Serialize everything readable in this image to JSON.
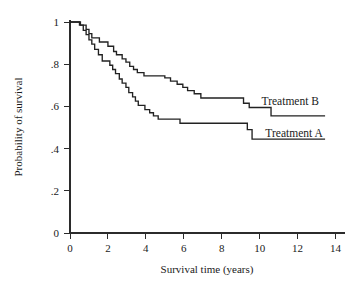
{
  "chart_data": {
    "type": "line",
    "subtype": "kaplan-meier-step",
    "title": "",
    "xlabel": "Survival time (years)",
    "ylabel": "Probability of survival",
    "xlim": [
      0,
      14.5
    ],
    "ylim": [
      0,
      1.0
    ],
    "xticks": [
      0,
      2,
      4,
      6,
      8,
      10,
      12,
      14
    ],
    "xticklabels": [
      "0",
      "2",
      "4",
      "6",
      "8",
      "10",
      "12",
      "14"
    ],
    "yticks": [
      0,
      0.2,
      0.4,
      0.6,
      0.8,
      1.0
    ],
    "yticklabels": [
      "0",
      ".2",
      ".4",
      ".6",
      ".8",
      "1"
    ],
    "grid": false,
    "legend_position": "inline-right",
    "series": [
      {
        "name": "Treatment B",
        "label": "Treatment B",
        "color": "#222222",
        "label_x": 10.1,
        "label_y": 0.625,
        "steps": [
          [
            0.0,
            1.0
          ],
          [
            0.55,
            1.0
          ],
          [
            0.55,
            0.985
          ],
          [
            0.85,
            0.985
          ],
          [
            0.85,
            0.965
          ],
          [
            1.0,
            0.965
          ],
          [
            1.0,
            0.945
          ],
          [
            1.15,
            0.945
          ],
          [
            1.15,
            0.925
          ],
          [
            1.55,
            0.925
          ],
          [
            1.55,
            0.905
          ],
          [
            2.0,
            0.905
          ],
          [
            2.0,
            0.885
          ],
          [
            2.3,
            0.885
          ],
          [
            2.3,
            0.86
          ],
          [
            2.45,
            0.86
          ],
          [
            2.45,
            0.845
          ],
          [
            2.75,
            0.845
          ],
          [
            2.75,
            0.825
          ],
          [
            2.95,
            0.825
          ],
          [
            2.95,
            0.81
          ],
          [
            3.15,
            0.81
          ],
          [
            3.15,
            0.79
          ],
          [
            3.35,
            0.79
          ],
          [
            3.35,
            0.775
          ],
          [
            3.55,
            0.775
          ],
          [
            3.55,
            0.76
          ],
          [
            3.9,
            0.76
          ],
          [
            3.9,
            0.745
          ],
          [
            5.0,
            0.745
          ],
          [
            5.0,
            0.735
          ],
          [
            5.3,
            0.735
          ],
          [
            5.3,
            0.72
          ],
          [
            5.65,
            0.72
          ],
          [
            5.65,
            0.705
          ],
          [
            5.95,
            0.705
          ],
          [
            5.95,
            0.69
          ],
          [
            6.2,
            0.69
          ],
          [
            6.2,
            0.675
          ],
          [
            6.55,
            0.675
          ],
          [
            6.55,
            0.66
          ],
          [
            6.9,
            0.66
          ],
          [
            6.9,
            0.64
          ],
          [
            9.15,
            0.64
          ],
          [
            9.15,
            0.615
          ],
          [
            9.45,
            0.615
          ],
          [
            9.45,
            0.595
          ],
          [
            10.6,
            0.595
          ],
          [
            10.6,
            0.555
          ],
          [
            13.45,
            0.555
          ]
        ]
      },
      {
        "name": "Treatment A",
        "label": "Treatment A",
        "color": "#222222",
        "label_x": 10.3,
        "label_y": 0.475,
        "steps": [
          [
            0.0,
            1.0
          ],
          [
            0.5,
            1.0
          ],
          [
            0.5,
            0.985
          ],
          [
            0.7,
            0.985
          ],
          [
            0.7,
            0.96
          ],
          [
            0.85,
            0.96
          ],
          [
            0.85,
            0.94
          ],
          [
            1.0,
            0.94
          ],
          [
            1.0,
            0.915
          ],
          [
            1.15,
            0.915
          ],
          [
            1.15,
            0.895
          ],
          [
            1.3,
            0.895
          ],
          [
            1.3,
            0.87
          ],
          [
            1.5,
            0.87
          ],
          [
            1.5,
            0.845
          ],
          [
            1.7,
            0.845
          ],
          [
            1.7,
            0.815
          ],
          [
            2.1,
            0.815
          ],
          [
            2.1,
            0.795
          ],
          [
            2.25,
            0.795
          ],
          [
            2.25,
            0.775
          ],
          [
            2.4,
            0.775
          ],
          [
            2.4,
            0.755
          ],
          [
            2.6,
            0.755
          ],
          [
            2.6,
            0.73
          ],
          [
            2.75,
            0.73
          ],
          [
            2.75,
            0.71
          ],
          [
            2.95,
            0.71
          ],
          [
            2.95,
            0.69
          ],
          [
            3.1,
            0.69
          ],
          [
            3.1,
            0.665
          ],
          [
            3.3,
            0.665
          ],
          [
            3.3,
            0.645
          ],
          [
            3.45,
            0.645
          ],
          [
            3.45,
            0.625
          ],
          [
            3.6,
            0.625
          ],
          [
            3.6,
            0.605
          ],
          [
            3.95,
            0.605
          ],
          [
            3.95,
            0.585
          ],
          [
            4.2,
            0.585
          ],
          [
            4.2,
            0.57
          ],
          [
            4.4,
            0.57
          ],
          [
            4.4,
            0.555
          ],
          [
            4.65,
            0.555
          ],
          [
            4.65,
            0.54
          ],
          [
            5.8,
            0.54
          ],
          [
            5.8,
            0.52
          ],
          [
            9.35,
            0.52
          ],
          [
            9.35,
            0.49
          ],
          [
            9.6,
            0.49
          ],
          [
            9.6,
            0.445
          ],
          [
            13.45,
            0.445
          ]
        ]
      }
    ]
  },
  "axes": {
    "x_title": "Survival time (years)",
    "y_title": "Probability of survival"
  }
}
